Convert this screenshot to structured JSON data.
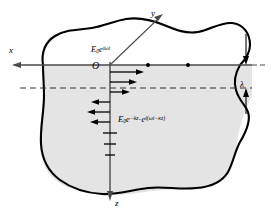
{
  "figure": {
    "type": "physics-diagram",
    "canvas": {
      "width": 271,
      "height": 221
    },
    "colors": {
      "medium_fill": "#e4e4e4",
      "boundary_stroke": "#000000",
      "axis_stroke": "#555555",
      "text": "#000000",
      "background": "#ffffff"
    }
  },
  "axes": {
    "x": {
      "label": "x",
      "direction": "left",
      "tip": [
        12,
        58
      ]
    },
    "y": {
      "label": "y",
      "direction": "upper-right",
      "tip": [
        163,
        14
      ]
    },
    "z": {
      "label": "z",
      "direction": "down",
      "tip": [
        110,
        198
      ]
    }
  },
  "origin": {
    "label": "O",
    "x": 110,
    "y": 65
  },
  "annotations": {
    "incident_field": {
      "base": "E",
      "subscript": "0",
      "factor": "e",
      "exponent": "iωt",
      "plain": "E0e^(iωt)"
    },
    "attenuated_field": {
      "base": "E",
      "subscript": "0",
      "factor1": "e",
      "exponent1": "−kz",
      "factor2": "e",
      "exponent2": "i(ωt−κz)",
      "plain": "E0e^(-kz)·e^(i(ωt-κz))"
    },
    "wavelength": {
      "label": "λ",
      "plain": "lambda",
      "description": "wavelength marked between solid axis line and dashed line"
    }
  },
  "field_arrows": {
    "description": "Decaying electric field vectors along the z axis",
    "items": [
      {
        "z": 72,
        "dir": "right",
        "length": 34
      },
      {
        "z": 82,
        "dir": "right",
        "length": 26
      },
      {
        "z": 92,
        "dir": "right",
        "length": 19
      },
      {
        "z": 102,
        "dir": "left",
        "length": 17
      },
      {
        "z": 112,
        "dir": "left",
        "length": 22
      },
      {
        "z": 122,
        "dir": "left",
        "length": 18
      },
      {
        "z": 132,
        "dir": "none",
        "length": 11
      },
      {
        "z": 142,
        "dir": "none",
        "length": 9
      },
      {
        "z": 152,
        "dir": "none",
        "length": 7
      }
    ]
  },
  "axis_dots": [
    {
      "x": 148,
      "y": 65
    },
    {
      "x": 188,
      "y": 65
    }
  ],
  "dashed_line": {
    "y": 88,
    "x_start": 20,
    "x_end": 252
  },
  "wavelength_markers": {
    "top_arrow": {
      "x": 246,
      "y_start": 36,
      "y_end": 64
    },
    "bottom_arrow": {
      "x": 246,
      "y_start": 110,
      "y_end": 88
    }
  }
}
